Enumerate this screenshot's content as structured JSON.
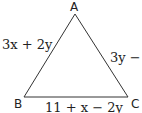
{
  "diagram": {
    "type": "triangle",
    "vertices": {
      "A": {
        "label": "A"
      },
      "B": {
        "label": "B"
      },
      "C": {
        "label": "C"
      }
    },
    "sides": {
      "AB": {
        "label": "3x + 2y"
      },
      "AC": {
        "label": "3y − 1"
      },
      "BC": {
        "label": "11 + x − 2y"
      }
    },
    "colors": {
      "stroke": "#333333",
      "text": "#222222"
    }
  }
}
